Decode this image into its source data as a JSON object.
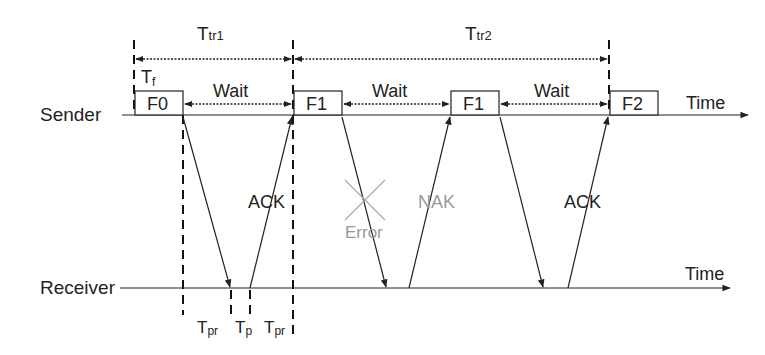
{
  "diagram": {
    "timelines": {
      "sender_label": "Sender",
      "receiver_label": "Receiver",
      "time_label_top": "Time",
      "time_label_bottom": "Time"
    },
    "intervals": {
      "ttr1": {
        "main": "T",
        "sub": "tr1"
      },
      "ttr2": {
        "main": "T",
        "sub": "tr2"
      },
      "tf": {
        "main": "T",
        "sub": "f"
      },
      "tpr_left": {
        "main": "T",
        "sub": "pr"
      },
      "tp": {
        "main": "T",
        "sub": "p"
      },
      "tpr_right": {
        "main": "T",
        "sub": "pr"
      }
    },
    "frames": [
      {
        "label": "F0"
      },
      {
        "label": "F1"
      },
      {
        "label": "F1"
      },
      {
        "label": "F2"
      }
    ],
    "waits": [
      "Wait",
      "Wait",
      "Wait"
    ],
    "responses": {
      "ack1": "ACK",
      "nak": "NAK",
      "ack2": "ACK",
      "error": "Error"
    },
    "colors": {
      "line": "#222222",
      "error_grey": "#9a9a9a"
    }
  }
}
